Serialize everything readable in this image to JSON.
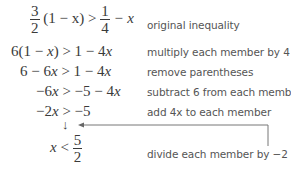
{
  "steps": [
    {
      "lhs_frac": {
        "num": "3",
        "den": "2"
      },
      "lhs_rest": "(1 − x) >",
      "rhs_frac": {
        "num": "1",
        "den": "4"
      },
      "rhs_rest": "− x",
      "note": "original inequality"
    },
    {
      "expr_a": "6(1 − ",
      "var_a": "x",
      "expr_b": ") > 1 − 4",
      "var_b": "x",
      "note": "multiply each member by 4"
    },
    {
      "expr_a": "6 − 6",
      "var_a": "x",
      "expr_b": " > 1 − 4",
      "var_b": "x",
      "note": "remove parentheses"
    },
    {
      "expr_a": "−6",
      "var_a": "x",
      "expr_b": " > −5 − 4",
      "var_b": "x",
      "note": "subtract 6 from each member"
    },
    {
      "expr_a": "−2",
      "var_a": "x",
      "expr_b": " > −5",
      "note": "add 4x to each member"
    },
    {
      "var": "x",
      "rel": " < ",
      "frac": {
        "num": "5",
        "den": "2"
      },
      "note": "divide each member by −2"
    }
  ],
  "arrow_symbol": "↓"
}
